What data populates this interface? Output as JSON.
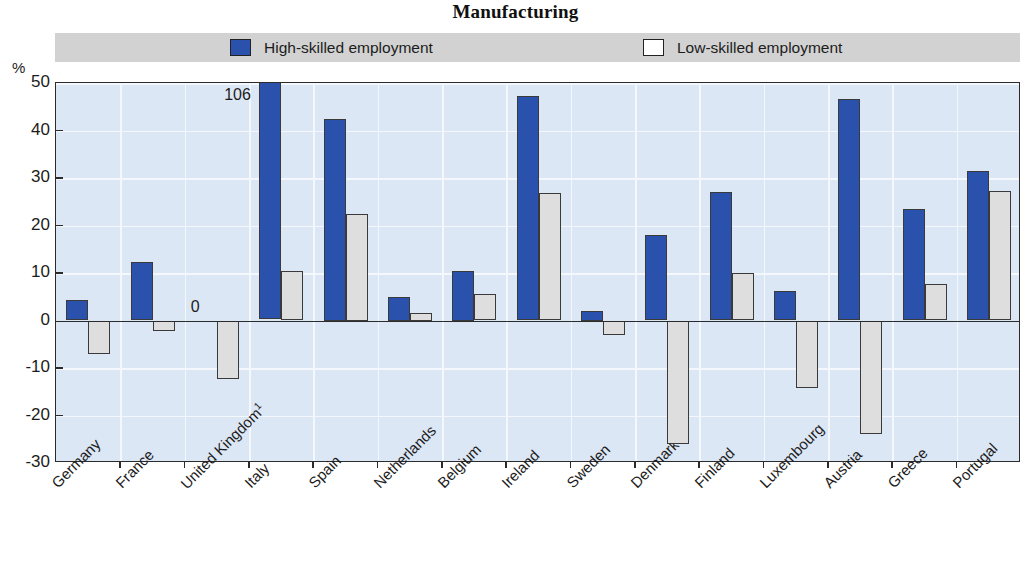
{
  "title": "Manufacturing",
  "axis_unit": "%",
  "legend": {
    "high": {
      "label": "High-skilled employment",
      "color": "#2a51ab"
    },
    "low": {
      "label": "Low-skilled employment",
      "color": "#dedede"
    }
  },
  "annotations": [
    {
      "text": "106",
      "category": "Italy",
      "series": "High-skilled employment"
    },
    {
      "text": "0",
      "category": "United Kingdom",
      "series": "High-skilled employment"
    }
  ],
  "chart_data": {
    "type": "bar",
    "title": "Manufacturing",
    "xlabel": "",
    "ylabel": "%",
    "ylim": [
      -30,
      50
    ],
    "yticks": [
      50,
      40,
      30,
      20,
      10,
      0,
      -10,
      -20,
      -30
    ],
    "grid": true,
    "legend_position": "top",
    "categories": [
      "Germany",
      "France",
      "United Kingdom¹",
      "Italy",
      "Spain",
      "Netherlands",
      "Belgium",
      "Ireland",
      "Sweden",
      "Denmark",
      "Finland",
      "Luxembourg",
      "Austria",
      "Greece",
      "Portugal"
    ],
    "series": [
      {
        "name": "High-skilled employment",
        "color": "#2a51ab",
        "values": [
          4.3,
          12.3,
          0,
          106,
          42.5,
          5.0,
          10.5,
          47.3,
          2.0,
          18.1,
          27.1,
          6.2,
          46.7,
          23.4,
          31.4
        ]
      },
      {
        "name": "Low-skilled employment",
        "color": "#dedede",
        "values": [
          -7.0,
          -2.3,
          -12.3,
          10.4,
          22.5,
          1.5,
          5.6,
          26.8,
          -3.1,
          -26.0,
          10.1,
          -14.2,
          -23.8,
          7.7,
          27.2
        ]
      }
    ]
  }
}
